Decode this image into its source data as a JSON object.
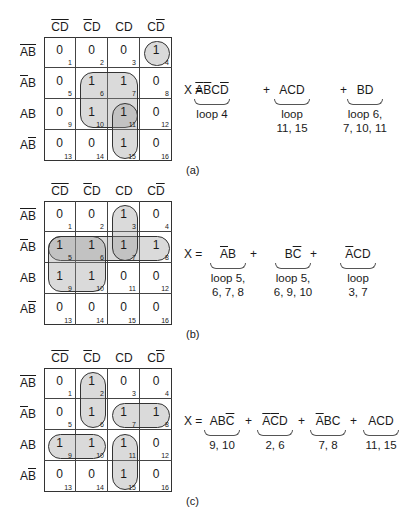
{
  "col_headers": [
    {
      "parts": [
        {
          "t": "C",
          "o": true
        },
        {
          "t": "D",
          "o": true
        }
      ]
    },
    {
      "parts": [
        {
          "t": "C",
          "o": true
        },
        {
          "t": "D",
          "o": false
        }
      ]
    },
    {
      "parts": [
        {
          "t": "C",
          "o": false
        },
        {
          "t": "D",
          "o": false
        }
      ]
    },
    {
      "parts": [
        {
          "t": "C",
          "o": false
        },
        {
          "t": "D",
          "o": true
        }
      ]
    }
  ],
  "row_headers": [
    {
      "parts": [
        {
          "t": "A",
          "o": true
        },
        {
          "t": "B",
          "o": true
        }
      ]
    },
    {
      "parts": [
        {
          "t": "A",
          "o": true
        },
        {
          "t": "B",
          "o": false
        }
      ]
    },
    {
      "parts": [
        {
          "t": "A",
          "o": false
        },
        {
          "t": "B",
          "o": false
        }
      ]
    },
    {
      "parts": [
        {
          "t": "A",
          "o": false
        },
        {
          "t": "B",
          "o": true
        }
      ]
    }
  ],
  "panels": [
    {
      "label": "(a)",
      "top": 0,
      "values": [
        [
          0,
          0,
          0,
          1
        ],
        [
          0,
          1,
          1,
          0
        ],
        [
          0,
          1,
          1,
          0
        ],
        [
          0,
          0,
          1,
          0
        ]
      ],
      "loops": [
        {
          "r": 0,
          "c": 3,
          "rs": 1,
          "cs": 1
        },
        {
          "r": 1,
          "c": 1,
          "rs": 2,
          "cs": 2
        },
        {
          "r": 2,
          "c": 2,
          "rs": 2,
          "cs": 1
        }
      ],
      "equation": {
        "lhs": "X =",
        "terms": [
          {
            "parts": [
              {
                "t": "A",
                "o": true
              },
              {
                "t": "B",
                "o": true
              },
              {
                "t": "C",
                "o": false
              },
              {
                "t": "D",
                "o": true
              }
            ],
            "note": [
              "loop 4"
            ],
            "x": 202
          },
          {
            "parts": [
              {
                "t": "A",
                "o": false
              },
              {
                "t": "C",
                "o": false
              },
              {
                "t": "D",
                "o": false
              }
            ],
            "note": [
              "loop",
              "11, 15"
            ],
            "x": 282
          },
          {
            "parts": [
              {
                "t": "B",
                "o": false
              },
              {
                "t": "D",
                "o": false
              }
            ],
            "note": [
              "loop 6,",
              "7, 10, 11"
            ],
            "x": 355
          }
        ],
        "plus_x": [
          263,
          340
        ]
      }
    },
    {
      "label": "(b)",
      "top": 164,
      "values": [
        [
          0,
          0,
          1,
          0
        ],
        [
          1,
          1,
          1,
          1
        ],
        [
          1,
          1,
          0,
          0
        ],
        [
          0,
          0,
          0,
          0
        ]
      ],
      "loops": [
        {
          "r": 1,
          "c": 0,
          "rs": 1,
          "cs": 4
        },
        {
          "r": 1,
          "c": 0,
          "rs": 2,
          "cs": 2
        },
        {
          "r": 0,
          "c": 2,
          "rs": 2,
          "cs": 1
        }
      ],
      "equation": {
        "lhs": "X =",
        "terms": [
          {
            "parts": [
              {
                "t": "A",
                "o": true
              },
              {
                "t": "B",
                "o": false
              }
            ],
            "note": [
              "loop 5,",
              "6, 7, 8"
            ],
            "x": 218
          },
          {
            "parts": [
              {
                "t": "B",
                "o": false
              },
              {
                "t": "C",
                "o": true
              }
            ],
            "note": [
              "loop 5,",
              "6, 9, 10"
            ],
            "x": 283
          },
          {
            "parts": [
              {
                "t": "A",
                "o": true
              },
              {
                "t": "C",
                "o": false
              },
              {
                "t": "D",
                "o": false
              }
            ],
            "note": [
              "loop",
              "3, 7"
            ],
            "x": 348
          }
        ],
        "plus_x": [
          250,
          310
        ]
      }
    },
    {
      "label": "(c)",
      "top": 331,
      "values": [
        [
          0,
          1,
          0,
          0
        ],
        [
          0,
          1,
          1,
          1
        ],
        [
          1,
          1,
          1,
          0
        ],
        [
          0,
          0,
          1,
          0
        ]
      ],
      "loops": [
        {
          "r": 0,
          "c": 1,
          "rs": 2,
          "cs": 1
        },
        {
          "r": 1,
          "c": 2,
          "rs": 1,
          "cs": 2
        },
        {
          "r": 2,
          "c": 0,
          "rs": 1,
          "cs": 2
        },
        {
          "r": 2,
          "c": 2,
          "rs": 2,
          "cs": 1
        }
      ],
      "equation": {
        "lhs": "X =",
        "terms": [
          {
            "parts": [
              {
                "t": "A",
                "o": false
              },
              {
                "t": "B",
                "o": false
              },
              {
                "t": "C",
                "o": true
              }
            ],
            "note": [
              "9, 10"
            ],
            "x": 212
          },
          {
            "parts": [
              {
                "t": "A",
                "o": true
              },
              {
                "t": "C",
                "o": true
              },
              {
                "t": "D",
                "o": false
              }
            ],
            "note": [
              "2, 6"
            ],
            "x": 265
          },
          {
            "parts": [
              {
                "t": "A",
                "o": true
              },
              {
                "t": "B",
                "o": false
              },
              {
                "t": "C",
                "o": false
              }
            ],
            "note": [
              "7, 8"
            ],
            "x": 318
          },
          {
            "parts": [
              {
                "t": "A",
                "o": false
              },
              {
                "t": "C",
                "o": false
              },
              {
                "t": "D",
                "o": false
              }
            ],
            "note": [
              "11, 15"
            ],
            "x": 371
          }
        ],
        "plus_x": [
          245,
          298,
          350
        ]
      }
    }
  ],
  "colors": {
    "loop_fill": "rgba(150,150,150,0.35)",
    "grid": "#333333"
  }
}
